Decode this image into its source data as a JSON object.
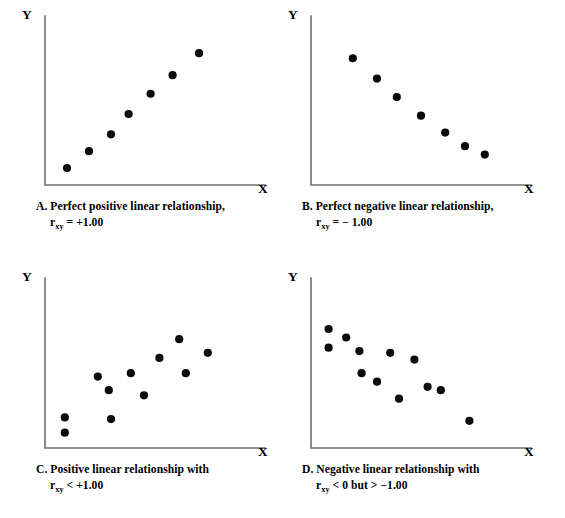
{
  "figure": {
    "background_color": "#ffffff",
    "dot_color": "#0a0a0a",
    "axis_color": "#6f6f72"
  },
  "labels": {
    "y": "Y",
    "x": "X"
  },
  "panels": [
    {
      "id": "A",
      "caption_line1": "A. Perfect positive linear relationship,",
      "caption_prefix": "r",
      "caption_subscript": "xy",
      "caption_line2_rest": " = +1.00",
      "y_label": "Y",
      "x_label": "X"
    },
    {
      "id": "B",
      "caption_line1": "B. Perfect negative linear relationship,",
      "caption_prefix": "r",
      "caption_subscript": "xy",
      "caption_line2_rest": " = − 1.00",
      "y_label": "Y",
      "x_label": "X"
    },
    {
      "id": "C",
      "caption_line1": "C. Positive linear relationship with",
      "caption_prefix": "r",
      "caption_subscript": "xy",
      "caption_line2_rest": " < +1.00",
      "y_label": "Y",
      "x_label": "X"
    },
    {
      "id": "D",
      "caption_line1": "D. Negative linear relationship with",
      "caption_prefix": "r",
      "caption_subscript": "xy",
      "caption_line2_rest": " < 0 but > −1.00",
      "y_label": "Y",
      "x_label": "X"
    }
  ],
  "chart_data": [
    {
      "type": "scatter",
      "panel": "A",
      "title": "A. Perfect positive linear relationship, r_xy = +1.00",
      "xlabel": "X",
      "ylabel": "Y",
      "correlation": 1.0,
      "correlation_text": "r_xy = +1.00",
      "grid": false,
      "legend": "none",
      "xlim": [
        0,
        10
      ],
      "ylim": [
        0,
        10
      ],
      "x": [
        1.0,
        2.0,
        3.0,
        3.8,
        4.8,
        5.8,
        7.0
      ],
      "y": [
        1.0,
        2.0,
        3.0,
        4.2,
        5.4,
        6.5,
        7.8
      ],
      "n_points": 7
    },
    {
      "type": "scatter",
      "panel": "B",
      "title": "B. Perfect negative linear relationship, r_xy = −1.00",
      "xlabel": "X",
      "ylabel": "Y",
      "correlation": -1.0,
      "correlation_text": "r_xy = −1.00",
      "grid": false,
      "legend": "none",
      "xlim": [
        0,
        10
      ],
      "ylim": [
        0,
        10
      ],
      "x": [
        1.9,
        3.0,
        3.9,
        5.0,
        6.1,
        7.0,
        7.9
      ],
      "y": [
        7.5,
        6.3,
        5.2,
        4.1,
        3.1,
        2.3,
        1.8
      ],
      "n_points": 7
    },
    {
      "type": "scatter",
      "panel": "C",
      "title": "C. Positive linear relationship with r_xy < +1.00",
      "xlabel": "X",
      "ylabel": "Y",
      "correlation_text": "r_xy < +1.00",
      "grid": false,
      "legend": "none",
      "xlim": [
        0,
        10
      ],
      "ylim": [
        0,
        10
      ],
      "x": [
        0.9,
        0.9,
        2.4,
        2.9,
        3.0,
        3.9,
        4.5,
        5.2,
        6.1,
        6.4,
        7.4
      ],
      "y": [
        1.8,
        0.9,
        4.2,
        3.4,
        1.7,
        4.4,
        3.1,
        5.3,
        6.4,
        4.4,
        5.6
      ],
      "n_points": 11
    },
    {
      "type": "scatter",
      "panel": "D",
      "title": "D. Negative linear relationship with r_xy < 0 but > −1.00",
      "xlabel": "X",
      "ylabel": "Y",
      "correlation_text": "r_xy < 0 but > −1.00",
      "grid": false,
      "legend": "none",
      "xlim": [
        0,
        10
      ],
      "ylim": [
        0,
        10
      ],
      "x": [
        0.8,
        0.8,
        1.6,
        2.2,
        2.3,
        3.0,
        3.6,
        4.0,
        4.7,
        5.3,
        5.9,
        7.2
      ],
      "y": [
        7.0,
        5.9,
        6.5,
        5.7,
        4.4,
        3.9,
        5.6,
        2.9,
        5.2,
        3.6,
        3.4,
        1.6
      ],
      "n_points": 12
    }
  ]
}
